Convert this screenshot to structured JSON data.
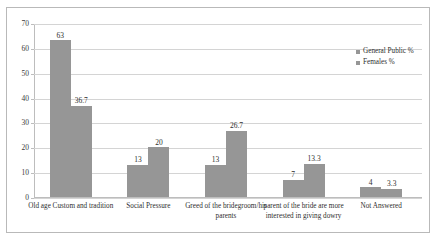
{
  "chart_data": {
    "type": "bar",
    "title": "",
    "xlabel": "",
    "ylabel": "",
    "ylim": [
      0,
      70
    ],
    "yticks": [
      0,
      10,
      20,
      30,
      40,
      50,
      60,
      70
    ],
    "grid": true,
    "legend_position": "top-right",
    "categories": [
      "Old age Custom and tradition",
      "Social Pressure",
      "Greed of the bridegroom/his parents",
      "parent of the bride are more interested in giving dowry",
      "Not Answered"
    ],
    "series": [
      {
        "name": "General Public %",
        "color": "#969696",
        "values": [
          63,
          13,
          13,
          7,
          4
        ],
        "labels": [
          "63",
          "13",
          "13",
          "7",
          "4"
        ]
      },
      {
        "name": "Females %",
        "color": "#969696",
        "values": [
          36.7,
          20,
          26.7,
          13.3,
          3.3
        ],
        "labels": [
          "36.7",
          "20",
          "26.7",
          "13.3",
          "3.3"
        ]
      }
    ]
  },
  "legend": {
    "items": [
      {
        "label": "General Public %"
      },
      {
        "label": "Females %"
      }
    ]
  }
}
